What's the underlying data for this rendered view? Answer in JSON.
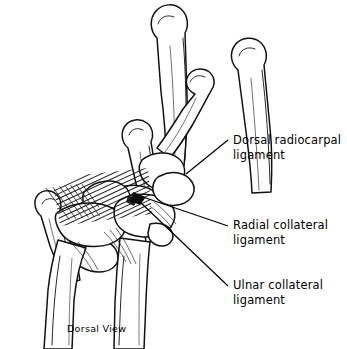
{
  "figure": {
    "caption": "Dorsal View",
    "ink_color": "#000000",
    "background_color": "#ffffff"
  },
  "labels": [
    {
      "id": "dorsal-radiocarpal",
      "text": "Dorsal radiocarpal\nligament",
      "line1": "Dorsal radiocarpal",
      "line2": "ligament"
    },
    {
      "id": "radial-collateral",
      "text": "Radial collateral\nligament",
      "line1": "Radial collateral",
      "line2": "ligament"
    },
    {
      "id": "ulnar-collateral",
      "text": "Ulnar collateral\nligament",
      "line1": "Ulnar collateral",
      "line2": "ligament"
    }
  ]
}
